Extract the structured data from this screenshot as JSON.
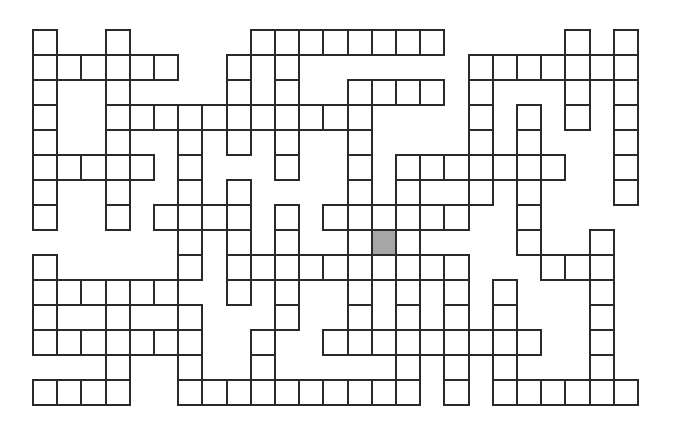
{
  "puzzle": {
    "type": "crossword-grid",
    "rows": 15,
    "cols": 25,
    "colors": {
      "cell_fill": "#ffffff",
      "cell_border": "#2a2a2a",
      "shaded_fill": "#a6a6a6"
    },
    "legend": {
      "#": "white cell",
      "G": "shaded cell",
      ".": "no cell"
    },
    "grid": [
      "#..#.....########.....#.#",
      "######..#.#.......#######",
      "#..#....#.#..####.#...#.#",
      "#..###########....#.#.#.#",
      "#..#..#.#.#..#....#.#...#",
      "#####.#...#..#.#######..#",
      "#..#..#.#....#.#..#.#...#",
      "#..#.####.#.######..#....",
      "......#.#.#..#G#....#..#.",
      "#.....#.##########...###.",
      "######..#.#..#.#.#.#...#.",
      "#..#..#...#..#.#.#.#...#.",
      "#######..#..#########..#.",
      "...#..#..#.....#.#.#...#.",
      "####..##########.#.######"
    ]
  }
}
